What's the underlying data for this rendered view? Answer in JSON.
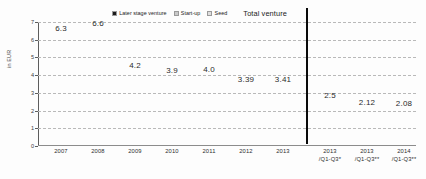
{
  "chart_data": {
    "type": "bar",
    "subtype": "stacked-bar",
    "title": "",
    "xlabel": "",
    "ylabel": "in EUR",
    "ylim": [
      0,
      7
    ],
    "yticks": [
      0,
      1,
      2,
      3,
      4,
      5,
      6,
      7
    ],
    "ytick_labels": [
      "0",
      "1",
      "2",
      "3",
      "4",
      "5",
      "6",
      "7"
    ],
    "grid": true,
    "legend_position": "top-center",
    "categories": [
      "2007",
      "2008",
      "2009",
      "2010",
      "2011",
      "2012",
      "2013",
      "2013 /Q1-Q3*",
      "2013 /Q1-Q3**",
      "2014 /Q1-Q3**"
    ],
    "category_lines": [
      [
        "2007",
        ""
      ],
      [
        "2008",
        ""
      ],
      [
        "2009",
        ""
      ],
      [
        "2010",
        ""
      ],
      [
        "2011",
        ""
      ],
      [
        "2012",
        ""
      ],
      [
        "2013",
        ""
      ],
      [
        "2013",
        "/Q1-Q3*"
      ],
      [
        "2013",
        "/Q1-Q3**"
      ],
      [
        "2014",
        "/Q1-Q3**"
      ]
    ],
    "series": [
      {
        "name": "Later stage venture",
        "color": "#1b1b1b",
        "values": [
          3.59,
          3.76,
          1.93,
          1.79,
          1.78,
          1.4,
          1.46,
          1.11,
          0.94,
          0.94
        ]
      },
      {
        "name": "Start-up",
        "color": "#b6b6b6",
        "values": [
          2.49,
          2.56,
          2.08,
          1.99,
          2.0,
          1.87,
          1.84,
          1.35,
          1.1,
          1.09
        ]
      },
      {
        "name": "Seed",
        "color": "#d9d9d9",
        "values": [
          0.2,
          0.29,
          0.15,
          0.14,
          0.17,
          0.12,
          0.12,
          0.08,
          0.09,
          0.08
        ]
      }
    ],
    "segment_labels": {
      "later_stage_venture": [
        "3.59",
        "3.76",
        "1.93",
        "1.79",
        "1.78",
        "1.40",
        "1.46",
        "1.11",
        "0.94",
        "0.94"
      ],
      "start_up": [
        "2.49",
        "2.56",
        "2.08",
        "1.99",
        "2.00",
        "1.87",
        "1.84",
        "1.35",
        "1.10",
        "1.09"
      ],
      "seed": [
        "0.20",
        "0.29",
        "0.15",
        "0.14",
        "0.17",
        "0.12",
        "0.12",
        "0.08",
        "0.09",
        "0.08"
      ]
    },
    "totals": [
      6.3,
      6.6,
      4.2,
      3.9,
      4.0,
      3.39,
      3.41,
      2.5,
      2.12,
      2.08
    ],
    "total_labels": [
      "6.3",
      "6.6",
      "4.2",
      "3.9",
      "4.0",
      "3.39",
      "3.41",
      "2.5",
      "2.12",
      "2.08"
    ],
    "annotations": [
      {
        "name": "group-divider",
        "description": "vertical black rule separating full-year bars from Q1-Q3 bars",
        "after_category": "2013"
      }
    ]
  },
  "legend": {
    "entries": [
      {
        "label": "Later stage venture",
        "color": "#1b1b1b"
      },
      {
        "label": "Start-up",
        "color": "#b6b6b6"
      },
      {
        "label": "Seed",
        "color": "#d9d9d9"
      }
    ],
    "total_label": "Total venture"
  },
  "axes": {
    "y_title": "in EUR",
    "y_tick_labels": [
      "7",
      "6",
      "5",
      "4",
      "3",
      "2",
      "1",
      "0"
    ]
  }
}
